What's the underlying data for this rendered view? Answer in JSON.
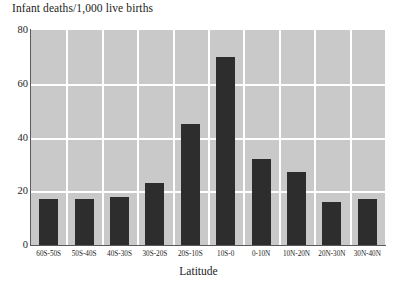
{
  "chart_data": {
    "type": "bar",
    "title": "Infant deaths/1,000 live births",
    "xlabel": "Latitude",
    "ylabel": "",
    "categories": [
      "60S-50S",
      "50S-40S",
      "40S-30S",
      "30S-20S",
      "20S-10S",
      "10S-0",
      "0-10N",
      "10N-20N",
      "20N-30N",
      "30N-40N"
    ],
    "values": [
      17,
      17,
      18,
      23,
      45,
      70,
      32,
      27,
      16,
      17
    ],
    "ylim": [
      0,
      80
    ],
    "yticks": [
      0,
      20,
      40,
      60,
      80
    ],
    "ytick_labels": [
      "0",
      "20",
      "40",
      "60",
      "80"
    ],
    "grid": "both",
    "legend": "none",
    "plot_background": "#c9c9c9",
    "gridline_color": "#ffffff",
    "bar_color": "#2d2d2d"
  }
}
